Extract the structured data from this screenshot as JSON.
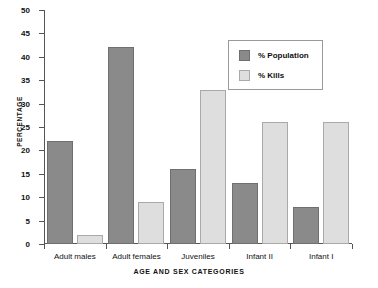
{
  "chart_data": {
    "type": "bar",
    "title": "",
    "xlabel": "AGE AND SEX CATEGORIES",
    "ylabel": "PERCENTAGE",
    "categories": [
      "Adult males",
      "Adult females",
      "Juveniles",
      "Infant II",
      "Infant I"
    ],
    "series": [
      {
        "name": "% Population",
        "values": [
          22,
          42,
          16,
          13,
          8
        ],
        "color": "#8a8a8a"
      },
      {
        "name": "% Kills",
        "values": [
          2,
          9,
          33,
          26,
          26
        ],
        "color": "#dedede"
      }
    ],
    "ylim": [
      0,
      50
    ],
    "ytick_step": 5,
    "yticks": [
      0,
      5,
      10,
      15,
      20,
      25,
      30,
      35,
      40,
      45,
      50
    ],
    "ytick_labels": [
      "0",
      "5",
      "10",
      "15",
      "20",
      "25",
      "30",
      "35",
      "40",
      "45",
      "50"
    ],
    "grid": false,
    "legend_position": "upper right",
    "legend_entries": [
      "% Population",
      "% Kills"
    ]
  }
}
